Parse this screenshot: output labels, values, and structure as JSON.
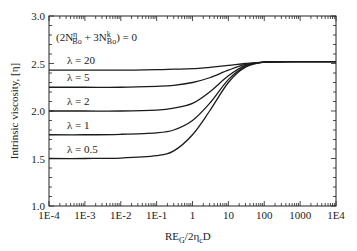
{
  "chart_data": {
    "type": "line",
    "title": "",
    "annotation": "(2N_Bo^η + 3N_Bo^k) = 0",
    "annotation_parts": {
      "open": "(2N",
      "sup1": "η",
      "sub1": "Bo",
      "mid": " + 3N",
      "sup2": "k",
      "sub2": "Bo",
      "close": ") = 0"
    },
    "xlabel": "RE_G/2η_cD",
    "xlabel_parts": {
      "a": "RE",
      "sub_a": "G",
      "b": "/2η",
      "sub_b": "c",
      "c": "D"
    },
    "ylabel": "Intrinsic viscosity, [η]",
    "xscale": "log",
    "xlim": [
      0.0001,
      10000
    ],
    "ylim": [
      1.0,
      3.0
    ],
    "grid": false,
    "legend_position": "inline labels above curves (left)",
    "x_ticks": [
      "1E-4",
      "1E-3",
      "1E-2",
      "1E-1",
      "1",
      "10",
      "100",
      "1000",
      "1E4"
    ],
    "y_ticks": [
      "1.0",
      "1.5",
      "2.0",
      "2.5",
      "3.0"
    ],
    "x": [
      0.0001,
      0.001,
      0.01,
      0.1,
      0.3,
      1,
      3,
      10,
      30,
      100,
      1000,
      10000
    ],
    "series": [
      {
        "name": "λ = 20",
        "label": "λ = 20",
        "values": [
          2.43,
          2.43,
          2.43,
          2.435,
          2.44,
          2.445,
          2.46,
          2.48,
          2.5,
          2.515,
          2.52,
          2.52
        ]
      },
      {
        "name": "λ = 5",
        "label": "λ = 5",
        "values": [
          2.25,
          2.25,
          2.25,
          2.26,
          2.27,
          2.3,
          2.35,
          2.43,
          2.49,
          2.515,
          2.52,
          2.52
        ]
      },
      {
        "name": "λ = 2",
        "label": "λ = 2",
        "values": [
          2.0,
          2.0,
          2.0,
          2.01,
          2.03,
          2.08,
          2.2,
          2.37,
          2.48,
          2.515,
          2.52,
          2.52
        ]
      },
      {
        "name": "λ = 1",
        "label": "λ = 1",
        "values": [
          1.75,
          1.75,
          1.755,
          1.77,
          1.8,
          1.9,
          2.08,
          2.33,
          2.47,
          2.515,
          2.52,
          2.52
        ]
      },
      {
        "name": "λ = 0.5",
        "label": "λ = 0.5",
        "values": [
          1.5,
          1.5,
          1.505,
          1.53,
          1.58,
          1.75,
          2.0,
          2.3,
          2.46,
          2.515,
          2.52,
          2.52
        ]
      }
    ]
  }
}
